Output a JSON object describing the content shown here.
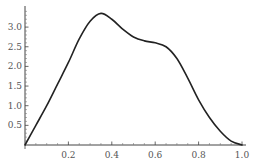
{
  "chart_data": {
    "type": "line",
    "title": "",
    "xlabel": "",
    "ylabel": "",
    "xlim": [
      0,
      1.0
    ],
    "ylim": [
      0,
      3.5
    ],
    "grid": false,
    "legend": null,
    "x_ticks": [
      "0.2",
      "0.4",
      "0.6",
      "0.8",
      "1.0"
    ],
    "y_ticks": [
      "0.5",
      "1.0",
      "1.5",
      "2.0",
      "2.5",
      "3.0"
    ],
    "series": [
      {
        "name": "curve",
        "color": "#222222",
        "x": [
          0.0,
          0.05,
          0.1,
          0.15,
          0.2,
          0.25,
          0.3,
          0.35,
          0.4,
          0.45,
          0.5,
          0.55,
          0.6,
          0.65,
          0.7,
          0.75,
          0.8,
          0.85,
          0.9,
          0.95,
          1.0
        ],
        "y": [
          0.0,
          0.5,
          1.0,
          1.55,
          2.1,
          2.7,
          3.15,
          3.35,
          3.2,
          2.95,
          2.75,
          2.65,
          2.6,
          2.5,
          2.2,
          1.7,
          1.15,
          0.7,
          0.35,
          0.1,
          0.0
        ]
      }
    ]
  }
}
